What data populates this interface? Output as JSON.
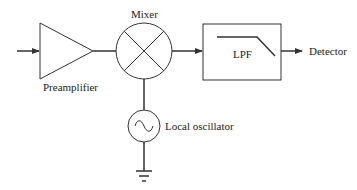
{
  "diagram": {
    "type": "block-diagram",
    "title": "",
    "colors": {
      "line": "#333333",
      "text": "#222222",
      "background": "#ffffff"
    },
    "blocks": [
      {
        "id": "preamplifier",
        "shape": "triangle",
        "label": "Preamplifier"
      },
      {
        "id": "mixer",
        "shape": "circle-x",
        "label": "Mixer"
      },
      {
        "id": "lpf",
        "shape": "rectangle",
        "label": "LPF"
      },
      {
        "id": "local_oscillator",
        "shape": "circle-sine",
        "label": "Local oscillator"
      },
      {
        "id": "ground",
        "shape": "ground-symbol",
        "label": ""
      }
    ],
    "output_label": "Detector",
    "connections": [
      {
        "from": "input",
        "to": "preamplifier",
        "arrow": true
      },
      {
        "from": "preamplifier",
        "to": "mixer",
        "arrow": false
      },
      {
        "from": "mixer",
        "to": "lpf",
        "arrow": true
      },
      {
        "from": "lpf",
        "to": "detector",
        "arrow": true
      },
      {
        "from": "local_oscillator",
        "to": "mixer",
        "arrow": false
      },
      {
        "from": "local_oscillator",
        "to": "ground",
        "arrow": false
      }
    ]
  },
  "labels": {
    "preamplifier": "Preamplifier",
    "mixer": "Mixer",
    "lpf": "LPF",
    "detector": "Detector",
    "local_oscillator": "Local oscillator"
  }
}
